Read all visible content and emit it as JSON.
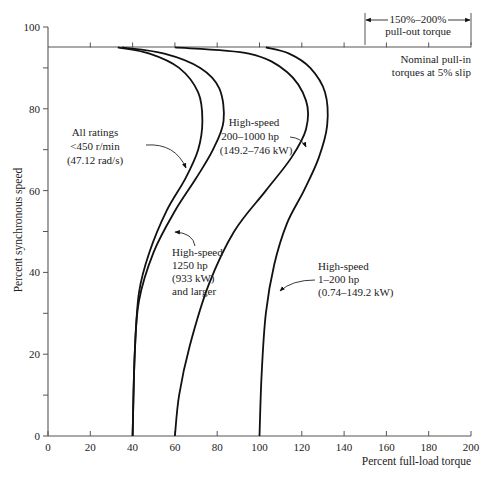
{
  "chart_data": {
    "type": "line",
    "title": "",
    "xlabel": "Percent  full-load torque",
    "ylabel": "Percent synchronous speed",
    "xlim": [
      0,
      200
    ],
    "ylim": [
      0,
      100
    ],
    "x_ticks": [
      "0",
      "20",
      "40",
      "60",
      "80",
      "100",
      "120",
      "140",
      "160",
      "180",
      "200"
    ],
    "y_ticks": [
      "0",
      "20",
      "40",
      "60",
      "80",
      "100"
    ],
    "grid": false,
    "reference_line": {
      "y": 95,
      "label": "Nominal pull-in torques at 5% slip"
    },
    "bracket": {
      "x_range": [
        150,
        200
      ],
      "label_line1": "150%–200%",
      "label_line2": "pull-out torque"
    },
    "series": [
      {
        "name": "All ratings <450 r/min (47.12 rad/s)",
        "points": [
          [
            40,
            0
          ],
          [
            41,
            20
          ],
          [
            43,
            35
          ],
          [
            48,
            45
          ],
          [
            56,
            55
          ],
          [
            65,
            63
          ],
          [
            71,
            70
          ],
          [
            73,
            77
          ],
          [
            71,
            84
          ],
          [
            62,
            90
          ],
          [
            48,
            93.5
          ],
          [
            33,
            95
          ]
        ]
      },
      {
        "name": "High-speed 1250 hp (933 kW) and larger",
        "points": [
          [
            40,
            0
          ],
          [
            41,
            20
          ],
          [
            43,
            33
          ],
          [
            50,
            45
          ],
          [
            60,
            55
          ],
          [
            70,
            63
          ],
          [
            78,
            70
          ],
          [
            83,
            77
          ],
          [
            81,
            85
          ],
          [
            72,
            90
          ],
          [
            55,
            93.5
          ],
          [
            35,
            95
          ]
        ]
      },
      {
        "name": "High-speed 200-1000 hp (149.2-746 kW)",
        "points": [
          [
            60,
            0
          ],
          [
            62,
            10
          ],
          [
            67,
            22
          ],
          [
            76,
            37
          ],
          [
            88,
            50
          ],
          [
            103,
            60
          ],
          [
            115,
            68
          ],
          [
            122,
            75
          ],
          [
            122,
            82
          ],
          [
            113,
            89
          ],
          [
            95,
            93.5
          ],
          [
            60,
            95
          ]
        ]
      },
      {
        "name": "High-speed 1-200 hp (0.74-149.2 kW)",
        "points": [
          [
            100,
            0
          ],
          [
            101,
            15
          ],
          [
            103,
            30
          ],
          [
            107,
            42
          ],
          [
            113,
            52
          ],
          [
            121,
            60
          ],
          [
            128,
            68
          ],
          [
            132,
            76
          ],
          [
            131,
            84
          ],
          [
            124,
            90
          ],
          [
            114,
            93.5
          ],
          [
            103,
            95
          ]
        ]
      }
    ],
    "annotations": [
      {
        "lines": [
          "All ratings",
          "<450 r/min",
          "(47.12 rad/s)"
        ]
      },
      {
        "lines": [
          "High-speed",
          "1250 hp",
          "(933 kW)",
          "and larger"
        ]
      },
      {
        "lines": [
          "High-speed",
          "200–1000 hp",
          "(149.2–746 kW)"
        ]
      },
      {
        "lines": [
          "High-speed",
          "1–200 hp",
          "(0.74–149.2 kW)"
        ]
      }
    ],
    "ref_label_lines": [
      "Nominal pull-in",
      "torques at 5% slip"
    ]
  }
}
